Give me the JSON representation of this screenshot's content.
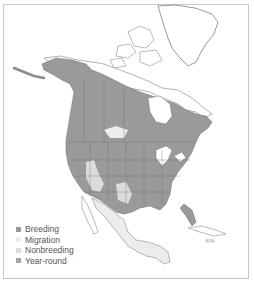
{
  "map": {
    "type": "range-map",
    "region": "North America",
    "colors": {
      "breeding": "#9a9a9a",
      "migration": "#ececec",
      "nonbreeding": "#dcdcdc",
      "year_round": "#a6a6a6",
      "land": "#ffffff",
      "border": "#6e6e6e",
      "water": "#ffffff"
    }
  },
  "legend": {
    "items": [
      {
        "label": "Breeding",
        "color": "#9a9a9a"
      },
      {
        "label": "Migration",
        "color": "#ececec"
      },
      {
        "label": "Nonbreeding",
        "color": "#dcdcdc"
      },
      {
        "label": "Year-round",
        "color": "#a6a6a6"
      }
    ]
  }
}
